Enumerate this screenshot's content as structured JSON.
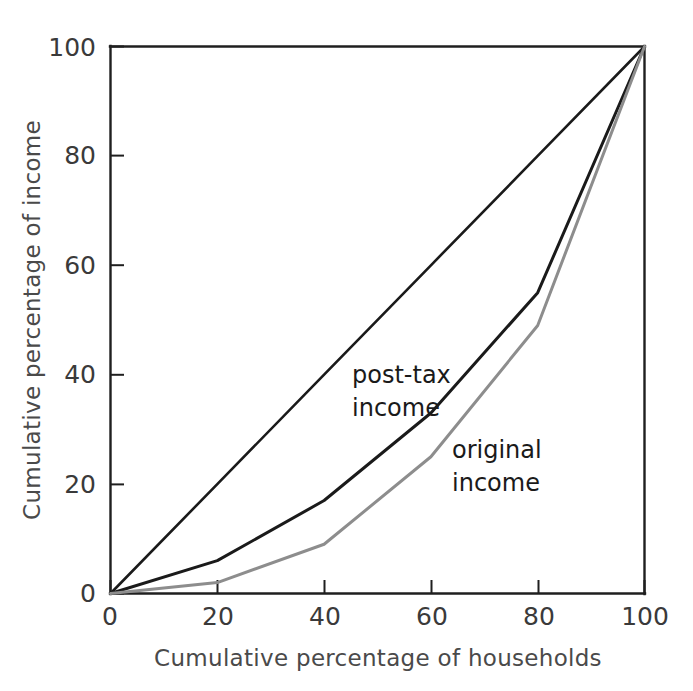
{
  "chart_data": {
    "type": "line",
    "title": "",
    "subtitle": "",
    "xlabel": "Cumulative percentage of households",
    "ylabel": "Cumulative percentage of income",
    "xlim": [
      0,
      100
    ],
    "ylim": [
      0,
      100
    ],
    "xticks": [
      "0",
      "20",
      "40",
      "60",
      "80",
      "100"
    ],
    "yticks": [
      "0",
      "20",
      "40",
      "60",
      "80",
      "100"
    ],
    "xtick_values": [
      0,
      20,
      40,
      60,
      80,
      100
    ],
    "ytick_values": [
      0,
      20,
      40,
      60,
      80,
      100
    ],
    "grid": false,
    "legend_position": "inline-annotations",
    "x": [
      0,
      20,
      40,
      60,
      80,
      100
    ],
    "series": [
      {
        "name": "line of equality",
        "color": "#1a1a1a",
        "width": 2.6,
        "values": [
          0,
          20,
          40,
          60,
          80,
          100
        ]
      },
      {
        "name": "post-tax income",
        "color": "#1a1a1a",
        "width": 3.0,
        "values": [
          0,
          6,
          17,
          33,
          55,
          100
        ]
      },
      {
        "name": "original income",
        "color": "#8d8d8d",
        "width": 3.0,
        "values": [
          0,
          2,
          9,
          25,
          49,
          100
        ]
      }
    ],
    "annotations": [
      {
        "name": "post-tax-income-label",
        "lines": [
          "post-tax",
          "income"
        ],
        "x": 52,
        "y": 41,
        "color": "#1a1a1a"
      },
      {
        "name": "original-income-label",
        "lines": [
          "original",
          "income"
        ],
        "x": 68,
        "y": 28,
        "color": "#1a1a1a"
      }
    ]
  },
  "axes": {
    "x_title": "Cumulative percentage of households",
    "y_title": "Cumulative percentage of income"
  },
  "annotations": {
    "post_tax_line1": "post-tax",
    "post_tax_line2": "income",
    "original_line1": "original",
    "original_line2": "income"
  },
  "ticks": {
    "x": {
      "t0": "0",
      "t1": "20",
      "t2": "40",
      "t3": "60",
      "t4": "80",
      "t5": "100"
    },
    "y": {
      "t0": "0",
      "t1": "20",
      "t2": "40",
      "t3": "60",
      "t4": "80",
      "t5": "100"
    }
  },
  "colors": {
    "axis": "#1f1f1f",
    "post_tax": "#1a1a1a",
    "original": "#8d8d8d",
    "equality": "#1a1a1a",
    "background": "#ffffff",
    "tick_text": "#3a3a3a",
    "axis_title_text": "#4a4a4a"
  }
}
